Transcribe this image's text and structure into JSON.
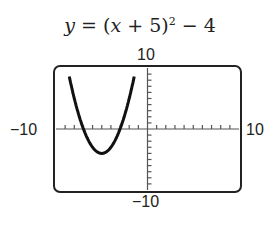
{
  "chart_data": {
    "type": "line",
    "equation": "y = (x + 5)^2 - 4",
    "xlim": [
      -10,
      10
    ],
    "ylim": [
      -10,
      10
    ],
    "xscale": 1,
    "yscale": 1,
    "tick_labels": {
      "ymax": "10",
      "ymin": "−10",
      "xmin": "−10",
      "xmax": "10"
    },
    "vertex": [
      -5,
      -4
    ],
    "x_intercepts": [
      -7,
      -3
    ],
    "series": [
      {
        "name": "y=(x+5)^2-4",
        "x": [
          -8.6,
          -8,
          -7,
          -6,
          -5,
          -4,
          -3,
          -2,
          -1.4
        ],
        "y": [
          8.96,
          5,
          0,
          -3,
          -4,
          -3,
          0,
          5,
          8.96
        ]
      }
    ],
    "grid": false
  },
  "labels": {
    "title_y": "y",
    "title_eq": " = (",
    "title_x": "x",
    "title_rest": " + 5)",
    "title_exp": "2",
    "title_tail": " − 4",
    "ymax": "10",
    "ymin": "−10",
    "xmin": "−10",
    "xmax": "10"
  }
}
